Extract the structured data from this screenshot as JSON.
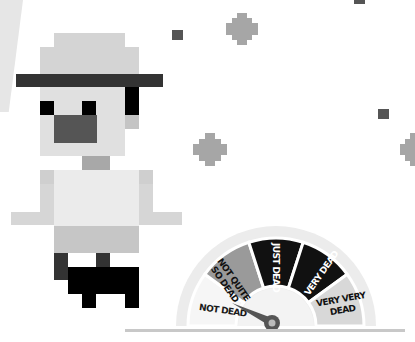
{
  "gauge": {
    "segments": [
      {
        "label": "NOT DEAD",
        "color": "#f4f4f4",
        "text_color": "#1a1a1a"
      },
      {
        "label_lines": [
          "NOT QUITE",
          "SO DEAD"
        ],
        "color": "#9a9a9a",
        "text_color": "#111111"
      },
      {
        "label": "JUST DEAD",
        "color": "#111111",
        "text_color": "#ffffff"
      },
      {
        "label": "VERY DEAD",
        "color": "#111111",
        "text_color": "#ffffff"
      },
      {
        "label_lines": [
          "VERY VERY",
          "DEAD"
        ],
        "color": "#d8d8d8",
        "text_color": "#111111"
      }
    ],
    "current_value": "NOT DEAD",
    "needle_color": "#555555",
    "ring_color": "#ececec"
  },
  "labels": {
    "not_dead": "NOT DEAD",
    "not_quite_1": "NOT QUITE",
    "not_quite_2": "SO DEAD",
    "just_dead": "JUST DEAD",
    "very_dead": "VERY DEAD",
    "very_very_1": "VERY VERY",
    "very_very_2": "DEAD"
  },
  "character": {
    "hat_color": "#d4d4d4",
    "hat_band_color": "#333333",
    "face_color": "#e0e0e0",
    "mouth_color": "#555555",
    "eye_color": "#000000",
    "shirt_color": "#ebebeb",
    "sleeve_color": "#cfcfcf",
    "pants_color": "#c6c6c6",
    "boot_color": "#000000"
  },
  "decorations": {
    "dark_square_color": "#555555",
    "sparkle_color": "#a6a6a6"
  }
}
